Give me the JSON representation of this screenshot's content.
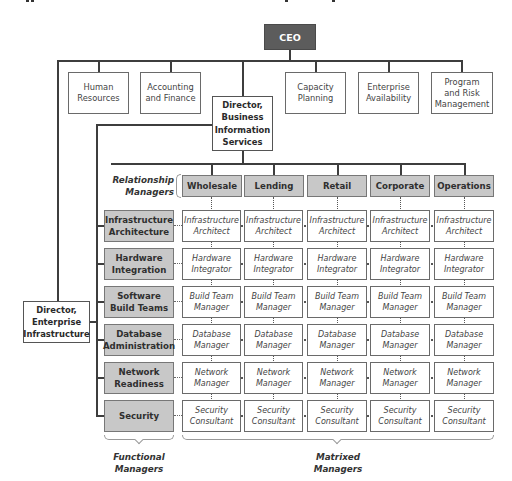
{
  "chart": {
    "ceo": "CEO",
    "staff_units": [
      {
        "name": "Human Resources",
        "lines": [
          "Human",
          "Resources"
        ]
      },
      {
        "name": "Accounting and Finance",
        "lines": [
          "Accounting",
          "and Finance"
        ]
      },
      {
        "name": "Capacity Planning",
        "lines": [
          "Capacity",
          "Planning"
        ]
      },
      {
        "name": "Enterprise Availability",
        "lines": [
          "Enterprise",
          "Availability"
        ]
      },
      {
        "name": "Program and Risk Management",
        "lines": [
          "Program",
          "and Risk",
          "Management"
        ]
      }
    ],
    "director_bis": {
      "lines": [
        "Director,",
        "Business",
        "Information",
        "Services"
      ]
    },
    "director_ei": {
      "lines": [
        "Director,",
        "Enterprise",
        "Infrastructure"
      ]
    },
    "relationship_label": [
      "Relationship",
      "Managers"
    ],
    "columns": [
      "Wholesale",
      "Lending",
      "Retail",
      "Corporate",
      "Operations"
    ],
    "rows": [
      {
        "functional": [
          "Infrastructure",
          "Architecture"
        ],
        "role": [
          "Infrastructure",
          "Architect"
        ]
      },
      {
        "functional": [
          "Hardware",
          "Integration"
        ],
        "role": [
          "Hardware",
          "Integrator"
        ]
      },
      {
        "functional": [
          "Software",
          "Build Teams"
        ],
        "role": [
          "Build Team",
          "Manager"
        ]
      },
      {
        "functional": [
          "Database",
          "Administration"
        ],
        "role": [
          "Database",
          "Manager"
        ]
      },
      {
        "functional": [
          "Network",
          "Readiness"
        ],
        "role": [
          "Network",
          "Manager"
        ]
      },
      {
        "functional": [
          "Security"
        ],
        "role": [
          "Security",
          "Consultant"
        ]
      }
    ],
    "functional_label": [
      "Functional",
      "Managers"
    ],
    "matrixed_label": [
      "Matrixed",
      "Managers"
    ]
  }
}
